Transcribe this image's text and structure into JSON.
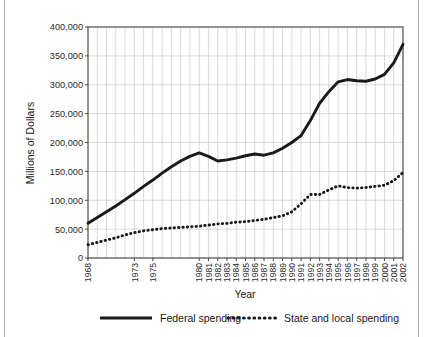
{
  "chart_data": {
    "type": "line",
    "title": "",
    "xlabel": "Year",
    "ylabel": "Millions of Dollars",
    "ylim": [
      0,
      400000
    ],
    "ytick_values": [
      0,
      50000,
      100000,
      150000,
      200000,
      250000,
      300000,
      350000,
      400000
    ],
    "ytick_labels": [
      "0",
      "50,000",
      "100,000",
      "150,000",
      "200,000",
      "250,000",
      "300,000",
      "350,000",
      "400,000"
    ],
    "grid": true,
    "legend_position": "bottom",
    "x": [
      1968,
      1969,
      1970,
      1971,
      1972,
      1973,
      1974,
      1975,
      1976,
      1977,
      1978,
      1979,
      1980,
      1981,
      1982,
      1983,
      1984,
      1985,
      1986,
      1987,
      1988,
      1989,
      1990,
      1991,
      1992,
      1993,
      1994,
      1995,
      1996,
      1997,
      1998,
      1999,
      2000,
      2001,
      2002
    ],
    "xtick_labels": [
      "1968",
      "",
      "",
      "",
      "",
      "1973",
      "",
      "1975",
      "",
      "",
      "",
      "",
      "1980",
      "1981",
      "1982",
      "1983",
      "1984",
      "1985",
      "1986",
      "1987",
      "1988",
      "1989",
      "1990",
      "1991",
      "1992",
      "1993",
      "1994",
      "1995",
      "1996",
      "1997",
      "1998",
      "1999",
      "2000",
      "2001",
      "2002"
    ],
    "series": [
      {
        "name": "Federal spending",
        "style": "solid",
        "color": "#1a1a1a",
        "values": [
          60000,
          70000,
          80000,
          90000,
          101000,
          112000,
          124000,
          135000,
          147000,
          158000,
          168000,
          176000,
          182000,
          176000,
          168000,
          170000,
          173000,
          177000,
          180000,
          178000,
          182000,
          190000,
          200000,
          212000,
          238000,
          268000,
          288000,
          305000,
          309000,
          307000,
          306000,
          310000,
          318000,
          338000,
          370000
        ]
      },
      {
        "name": "State and local spending",
        "style": "dotted",
        "color": "#1a1a1a",
        "values": [
          23000,
          27000,
          31000,
          35000,
          40000,
          44000,
          47000,
          49000,
          51000,
          52000,
          53000,
          54000,
          55000,
          57000,
          59000,
          60000,
          62000,
          63000,
          65000,
          67000,
          70000,
          73000,
          80000,
          94000,
          110000,
          110000,
          118000,
          125000,
          122000,
          121000,
          122000,
          124000,
          126000,
          134000,
          148000
        ]
      }
    ]
  },
  "legend": {
    "items": [
      {
        "label": "Federal spending",
        "style": "solid"
      },
      {
        "label": "State and local spending",
        "style": "dotted"
      }
    ]
  }
}
